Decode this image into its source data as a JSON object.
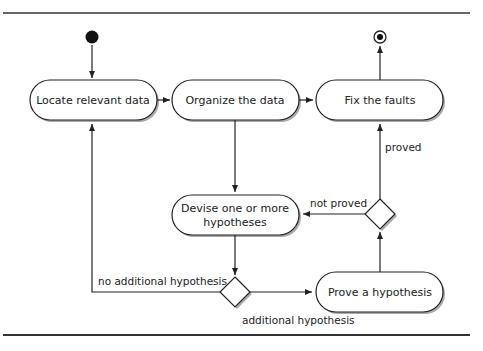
{
  "diagram": {
    "type": "activity",
    "nodes": {
      "locate": "Locate relevant data",
      "organize": "Organize the data",
      "fix": "Fix the faults",
      "devise_line1": "Devise one or more",
      "devise_line2": "hypotheses",
      "prove": "Prove a hypothesis"
    },
    "edges": {
      "proved": "proved",
      "not_proved": "not proved",
      "no_additional": "no additional hypothesis",
      "additional": "additional hypothesis"
    },
    "colors": {
      "stroke": "#222222",
      "fill": "#ffffff",
      "shadow": "#999999",
      "text": "#222222"
    }
  }
}
